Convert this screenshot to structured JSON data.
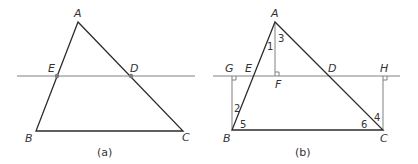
{
  "figure_a": {
    "caption": "(a)",
    "points": {
      "A": {
        "label": "A",
        "x": 78,
        "y": 22
      },
      "B": {
        "label": "B",
        "x": 36,
        "y": 131
      },
      "C": {
        "label": "C",
        "x": 183,
        "y": 131
      },
      "E": {
        "label": "E",
        "x": 57,
        "y": 76
      },
      "D": {
        "label": "D",
        "x": 131,
        "y": 76
      }
    },
    "line": {
      "x1": 17,
      "x2": 195,
      "y": 76
    }
  },
  "figure_b": {
    "caption": "(b)",
    "points": {
      "A": {
        "label": "A"
      },
      "B": {
        "label": "B"
      },
      "C": {
        "label": "C"
      },
      "D": {
        "label": "D"
      },
      "E": {
        "label": "E"
      },
      "F": {
        "label": "F"
      },
      "G": {
        "label": "G"
      },
      "H": {
        "label": "H"
      }
    },
    "angles": [
      "1",
      "2",
      "3",
      "4",
      "5",
      "6"
    ]
  }
}
